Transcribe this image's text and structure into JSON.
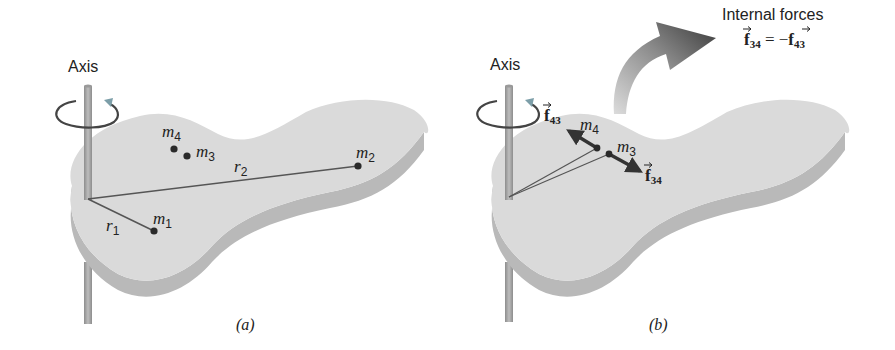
{
  "figure": {
    "panels": [
      {
        "id": "a",
        "caption": "(a)",
        "axis_label": "Axis",
        "masses": [
          {
            "name": "m",
            "sub": "1"
          },
          {
            "name": "m",
            "sub": "2"
          },
          {
            "name": "m",
            "sub": "3"
          },
          {
            "name": "m",
            "sub": "4"
          }
        ],
        "radii": [
          {
            "name": "r",
            "sub": "1"
          },
          {
            "name": "r",
            "sub": "2"
          }
        ]
      },
      {
        "id": "b",
        "caption": "(b)",
        "axis_label": "Axis",
        "masses": [
          {
            "name": "m",
            "sub": "3"
          },
          {
            "name": "m",
            "sub": "4"
          }
        ],
        "forces": [
          {
            "name": "f",
            "sub": "43"
          },
          {
            "name": "f",
            "sub": "34"
          }
        ],
        "callout": {
          "title": "Internal forces",
          "lhs": "f",
          "lhs_sub": "34",
          "eq": " = −",
          "rhs": "f",
          "rhs_sub": "43"
        }
      }
    ],
    "colors": {
      "plate_top": "#d9d9d9",
      "plate_edge": "#b5b5b5",
      "axis_rod": "#a8a8a8",
      "line": "#555555",
      "dot": "#2a2a2a",
      "callout_arrow": "#4a4a4a"
    }
  }
}
